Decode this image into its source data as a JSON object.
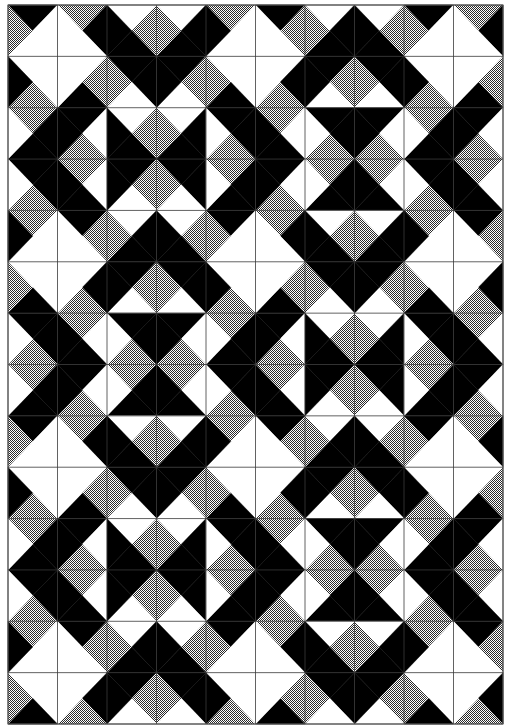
{
  "artwork": {
    "title": "Quarter-square triangle quilt pattern",
    "canvas": {
      "width": 508,
      "height": 728
    },
    "board": {
      "x": 8,
      "y": 5,
      "width": 495,
      "height": 719
    },
    "grid": {
      "cols": 10,
      "rows": 14
    },
    "colors": {
      "K": "#000000",
      "W": "#ffffff",
      "G_light": "#ffffff",
      "G_dark": "#2a2a2a",
      "gridline": "#3a3a3a",
      "border": "#555555"
    },
    "legend": {
      "K": "black",
      "W": "white",
      "G": "gray-hatched"
    },
    "cell_encoding": "each cell is 4 characters: Top, Right, Bottom, Left triangle colors (K=black, W=white, G=gray hatch)",
    "cells": [
      [
        "KWWG",
        "GKWW",
        "WGKK",
        "WKKG",
        "GWWK",
        "KGWW",
        "WKKG",
        "WGKK",
        "KWWG",
        "GKWW"
      ],
      [
        "WWGK",
        "WGKW",
        "KKWG",
        "KGWK",
        "WWKG",
        "WKGW",
        "KGWK",
        "KKWG",
        "WWGK",
        "WGKW"
      ],
      [
        "GKKW",
        "KWGK",
        "WGKK",
        "WKKG",
        "KKGW",
        "GWKK",
        "KKGW",
        "KWGK",
        "GKKW",
        "KWGK"
      ],
      [
        "KKGW",
        "GWKK",
        "KGWK",
        "KKWG",
        "GKKW",
        "KWGK",
        "GKKW",
        "GWKK",
        "KKGW",
        "GWKK"
      ],
      [
        "GWWK",
        "KGWW",
        "WKKG",
        "WGKK",
        "KWWG",
        "GKWW",
        "WGKK",
        "WKKG",
        "GWWK",
        "KGWW"
      ],
      [
        "WWKG",
        "WKGW",
        "KGWK",
        "KKWG",
        "WWGK",
        "WGKW",
        "KKWG",
        "KGWK",
        "WWKG",
        "WKGW"
      ],
      [
        "KKGW",
        "GWKK",
        "KKGW",
        "KWGK",
        "GKKW",
        "KWGK",
        "WGKK",
        "WKKG",
        "KKGW",
        "GWKK"
      ],
      [
        "GKKW",
        "KWGK",
        "GKKW",
        "GWKK",
        "KKGW",
        "GWKK",
        "KGWK",
        "KKWG",
        "GKKW",
        "KWGK"
      ],
      [
        "KWWG",
        "GKWW",
        "WGKK",
        "WKKG",
        "GWWK",
        "KGWW",
        "WKKG",
        "WGKK",
        "KWWG",
        "GKWW"
      ],
      [
        "WWGK",
        "WGKW",
        "KKWG",
        "KGWK",
        "WWKG",
        "WKGW",
        "KGWK",
        "KKWG",
        "WWGK",
        "WGKW"
      ],
      [
        "GKKW",
        "KWGK",
        "WGKK",
        "WKKG",
        "KKGW",
        "GWKK",
        "KKGW",
        "KWGK",
        "GKKW",
        "KWGK"
      ],
      [
        "KKGW",
        "GWKK",
        "KGWK",
        "KKWG",
        "GKKW",
        "KWGK",
        "GKKW",
        "GWKK",
        "KKGW",
        "GWKK"
      ],
      [
        "GWWK",
        "KGWW",
        "WKKG",
        "WGKK",
        "KWWG",
        "GKWW",
        "WGKK",
        "WKKG",
        "GWWK",
        "KGWW"
      ],
      [
        "WWKG",
        "WKGW",
        "KGWK",
        "KKWG",
        "WWGK",
        "WGKW",
        "KKWG",
        "KGWK",
        "WWKG",
        "WKGW"
      ]
    ]
  }
}
